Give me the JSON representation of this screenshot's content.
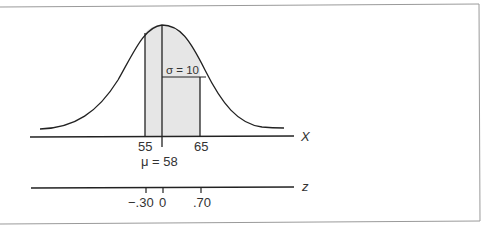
{
  "figure": {
    "distribution": "normal",
    "mean_label": "μ = 58",
    "sigma_label": "σ = 10",
    "x_axis": {
      "name": "X",
      "ticks": [
        "55",
        "65"
      ],
      "mean_value": 58
    },
    "z_axis": {
      "name": "z",
      "ticks": [
        "−.30",
        "0",
        ".70"
      ]
    },
    "shaded_interval": {
      "from": 55,
      "to": 65
    }
  },
  "colors": {
    "line": "#222222",
    "shade": "#e6e6e6",
    "border": "#999999",
    "text": "#333333"
  }
}
